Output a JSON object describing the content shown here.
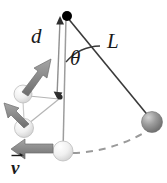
{
  "figure": {
    "type": "physics-diagram",
    "width": 167,
    "height": 183,
    "background_color": "#ffffff"
  },
  "labels": {
    "d": "d",
    "theta": "θ",
    "L": "L",
    "v": "v"
  },
  "icons": {
    "velocity_vector_arrow": "vector-arrow-icon"
  },
  "colors": {
    "line": "#3a3a3a",
    "pivot": "#000000",
    "ball_dark": "#8e8e8e",
    "ball_light": "#e8e8e8",
    "arrow_gray": "#8a8a8a",
    "arrow_dark": "#6f6f6f",
    "dashed_arc": "#9a9a9a",
    "text": "#1a1a1a"
  },
  "geometry": {
    "pivot": {
      "x": 67,
      "y": 17
    },
    "peg": {
      "x": 63,
      "y": 97
    },
    "string_length_L": 120,
    "distance_d": 80,
    "angle_theta_degrees": 42,
    "balls": [
      {
        "name": "ball-right-released",
        "x": 152,
        "y": 122,
        "r": 10,
        "shade": "dark"
      },
      {
        "name": "ball-bottom-lowest",
        "x": 63,
        "y": 150,
        "r": 10,
        "shade": "light"
      },
      {
        "name": "ball-mid-left",
        "x": 25,
        "y": 127,
        "r": 9,
        "shade": "light"
      },
      {
        "name": "ball-upper-left",
        "x": 23,
        "y": 95,
        "r": 9,
        "shade": "light"
      }
    ],
    "vectors": [
      {
        "name": "velocity-at-lowest-point",
        "from": {
          "x": 55,
          "y": 148
        },
        "to": {
          "x": 13,
          "y": 148
        }
      },
      {
        "name": "velocity-mid-left",
        "from": {
          "x": 30,
          "y": 120
        },
        "to": {
          "x": 8,
          "y": 106
        }
      },
      {
        "name": "velocity-upper-left",
        "from": {
          "x": 24,
          "y": 92
        },
        "to": {
          "x": 48,
          "y": 60
        }
      }
    ],
    "dashed_arc": {
      "name": "swing-path-arc",
      "from": {
        "x": 73,
        "y": 152
      },
      "to": {
        "x": 150,
        "y": 131
      }
    }
  }
}
